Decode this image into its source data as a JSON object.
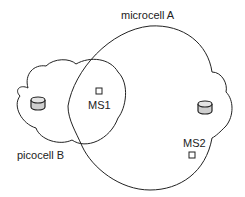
{
  "diagram": {
    "labels": {
      "microcell": "microcell A",
      "picocell": "picocell B",
      "ms1": "MS1",
      "ms2": "MS2"
    },
    "colors": {
      "stroke": "#222222",
      "bs_fill": "#cccccc",
      "background": "#ffffff"
    }
  }
}
